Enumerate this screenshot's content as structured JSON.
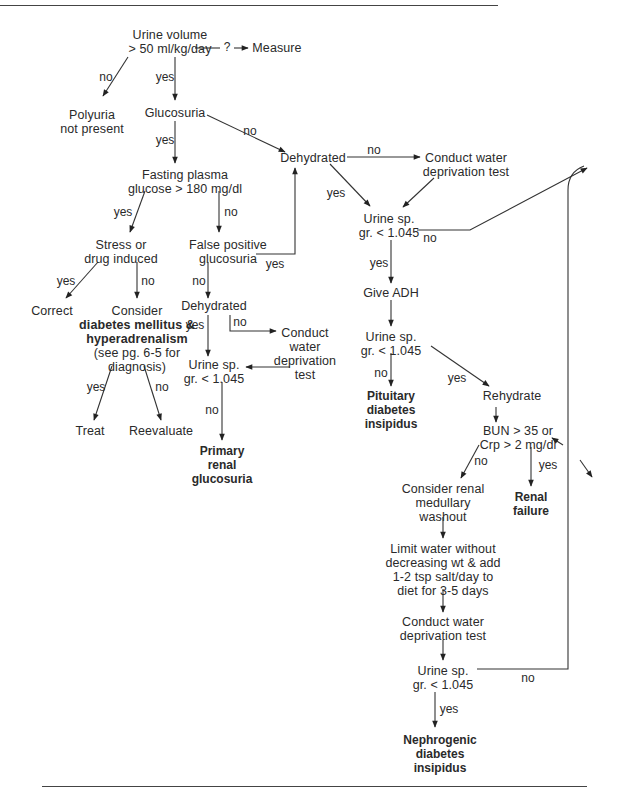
{
  "figure": {
    "nodes": {
      "urine_volume": {
        "lines": [
          "Urine volume",
          "> 50 ml/kg/day"
        ]
      },
      "measure": {
        "lines": [
          "Measure"
        ]
      },
      "polyuria_not_present": {
        "lines": [
          "Polyuria",
          "not present"
        ]
      },
      "glucosuria": {
        "lines": [
          "Glucosuria"
        ]
      },
      "fasting_plasma": {
        "lines": [
          "Fasting plasma",
          "glucose > 180 mg/dl"
        ]
      },
      "dehydrated_top": {
        "lines": [
          "Dehydrated"
        ]
      },
      "conduct_wdt_top": {
        "lines": [
          "Conduct water",
          "deprivation test"
        ]
      },
      "stress_drug": {
        "lines": [
          "Stress or",
          "drug induced"
        ]
      },
      "false_positive": {
        "lines": [
          "False positive",
          "glucosuria"
        ]
      },
      "urine_sg_1": {
        "lines": [
          "Urine sp.",
          "gr. < 1.045"
        ]
      },
      "correct": {
        "lines": [
          "Correct"
        ]
      },
      "consider_dm": {
        "lines": [
          "Consider"
        ],
        "bold_lines": [
          "diabetes mellitus &",
          "hyperadrenalism"
        ],
        "tail_lines": [
          "(see pg. 6-5 for",
          "diagnosis)"
        ]
      },
      "dehydrated_mid": {
        "lines": [
          "Dehydrated"
        ]
      },
      "conduct_wdt_mid": {
        "lines": [
          "Conduct",
          "water",
          "deprivation",
          "test"
        ]
      },
      "urine_sg_mid": {
        "lines": [
          "Urine sp.",
          "gr. < 1.045"
        ]
      },
      "give_adh": {
        "lines": [
          "Give ADH"
        ]
      },
      "urine_sg_2": {
        "lines": [
          "Urine sp.",
          "gr. < 1.045"
        ]
      },
      "pituitary_di": {
        "lines": [
          "Pituitary",
          "diabetes",
          "insipidus"
        ],
        "bold": true
      },
      "rehydrate": {
        "lines": [
          "Rehydrate"
        ]
      },
      "treat": {
        "lines": [
          "Treat"
        ]
      },
      "reevaluate": {
        "lines": [
          "Reevaluate"
        ]
      },
      "primary_renal": {
        "lines": [
          "Primary",
          "renal",
          "glucosuria"
        ],
        "bold": true
      },
      "bun_cr": {
        "lines": [
          "BUN > 35 or",
          "Crp > 2 mg/dl"
        ]
      },
      "consider_washout": {
        "lines": [
          "Consider renal",
          "medullary",
          "washout"
        ]
      },
      "renal_failure": {
        "lines": [
          "Renal",
          "failure"
        ],
        "bold": true
      },
      "limit_water": {
        "lines": [
          "Limit water without",
          "decreasing wt & add",
          "1-2 tsp salt/day to",
          "diet for 3-5 days"
        ]
      },
      "conduct_wdt_bottom": {
        "lines": [
          "Conduct water",
          "deprivation test"
        ]
      },
      "urine_sg_3": {
        "lines": [
          "Urine sp.",
          "gr. < 1.045"
        ]
      },
      "nephrogenic_di": {
        "lines": [
          "Nephrogenic",
          "diabetes",
          "insipidus"
        ],
        "bold": true
      }
    },
    "edge_labels": {
      "q": "?",
      "uv_no": "no",
      "uv_yes": "yes",
      "gl_no": "no",
      "gl_yes": "yes",
      "dh_no": "no",
      "dh_yes": "yes",
      "sg1_no": "no",
      "sg1_yes": "yes",
      "fp_yes": "yes",
      "fp_no": "no",
      "fpg_yes": "yes",
      "fpg_no": "no",
      "st_yes": "yes",
      "st_no": "no",
      "fpos_yes": "yes",
      "fpos_no": "no",
      "dhm_yes": "yes",
      "dhm_no": "no",
      "sgm_no": "no",
      "cdm_yes": "yes",
      "cdm_no": "no",
      "sg2_no": "no",
      "sg2_yes": "yes",
      "bun_no": "no",
      "bun_yes": "yes",
      "sg3_yes": "yes",
      "sg3_no": "no"
    }
  }
}
